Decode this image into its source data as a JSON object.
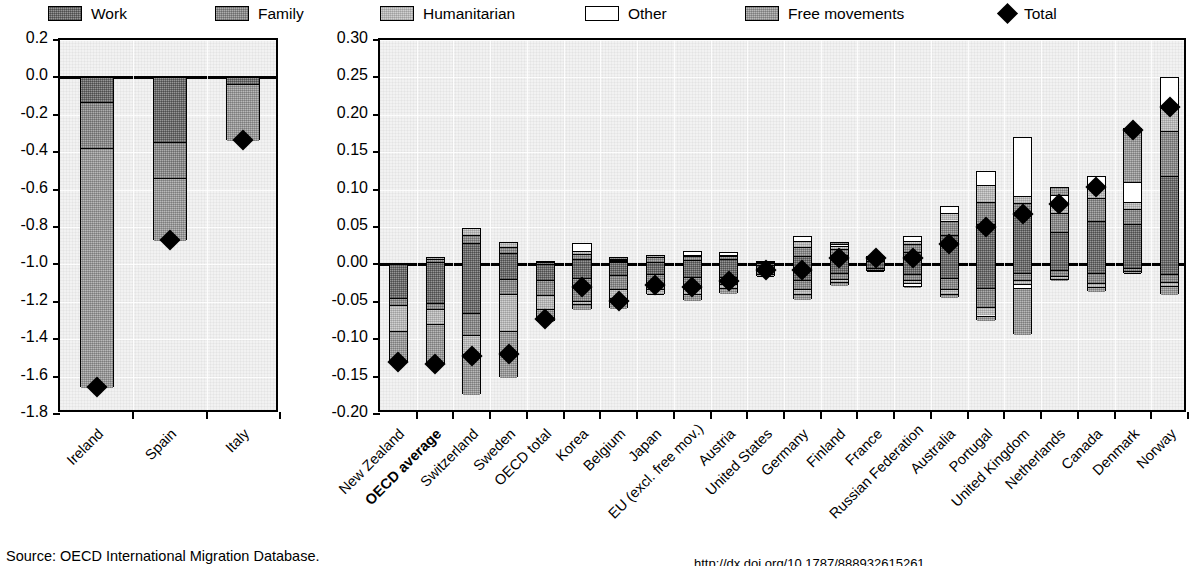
{
  "legend": {
    "items": [
      {
        "label": "Work",
        "fill": "work",
        "icon": "legend-swatch"
      },
      {
        "label": "Family",
        "fill": "family",
        "icon": "legend-swatch"
      },
      {
        "label": "Humanitarian",
        "fill": "human",
        "icon": "legend-swatch"
      },
      {
        "label": "Other",
        "fill": "other",
        "icon": "legend-swatch"
      },
      {
        "label": "Free movements",
        "fill": "free",
        "icon": "legend-swatch"
      },
      {
        "label": "Total",
        "fill": "diamond",
        "icon": "diamond-marker"
      }
    ]
  },
  "source": {
    "text": "Source: OECD International Migration Database.",
    "doi": "http://dx.doi.org/10.1787/888932615261"
  },
  "chart_data": [
    {
      "id": "left-panel",
      "type": "bar",
      "stacked": true,
      "title": "",
      "xlabel": "",
      "ylabel": "",
      "ylim": [
        -1.8,
        0.2
      ],
      "yticks": [
        0.2,
        0.0,
        -0.2,
        -0.4,
        -0.6,
        -0.8,
        -1.0,
        -1.2,
        -1.4,
        -1.6,
        -1.8
      ],
      "ytick_labels": [
        "0.2",
        "0.0",
        "-0.2",
        "-0.4",
        "-0.6",
        "-0.8",
        "-1.0",
        "-1.2",
        "-1.4",
        "-1.6",
        "-1.8"
      ],
      "grid": true,
      "categories": [
        "Ireland",
        "Spain",
        "Italy"
      ],
      "series": [
        {
          "name": "Work",
          "values": [
            -0.125,
            -0.34,
            -0.03
          ]
        },
        {
          "name": "Family",
          "values": [
            -0.245,
            -0.195,
            0
          ]
        },
        {
          "name": "Humanitarian",
          "values": [
            0,
            0,
            0
          ]
        },
        {
          "name": "Other",
          "values": [
            0,
            0,
            0
          ]
        },
        {
          "name": "Free movements",
          "values": [
            -1.285,
            -0.335,
            -0.305
          ]
        }
      ],
      "totals": [
        -1.655,
        -0.87,
        -0.335
      ]
    },
    {
      "id": "right-panel",
      "type": "bar",
      "stacked": true,
      "title": "",
      "xlabel": "",
      "ylabel": "",
      "ylim": [
        -0.2,
        0.3
      ],
      "yticks": [
        0.3,
        0.25,
        0.2,
        0.15,
        0.1,
        0.05,
        0.0,
        -0.05,
        -0.1,
        -0.15,
        -0.2
      ],
      "ytick_labels": [
        "0.30",
        "0.25",
        "0.20",
        "0.15",
        "0.10",
        "0.05",
        "0.00",
        "-0.05",
        "-0.10",
        "-0.15",
        "-0.20"
      ],
      "grid": true,
      "categories": [
        "New Zealand",
        "OECD average",
        "Switzerland",
        "Sweden",
        "OECD total",
        "Korea",
        "Belgium",
        "Japan",
        "EU (excl. free mov.)",
        "Austria",
        "United States",
        "Germany",
        "Finland",
        "France",
        "Russian Federation",
        "Australia",
        "Portugal",
        "United Kingdom",
        "Netherlands",
        "Canada",
        "Denmark",
        "Norway"
      ],
      "bold_categories": [
        "OECD average"
      ],
      "series": [
        {
          "name": "Work",
          "neg": [
            -0.043,
            -0.05,
            -0.063,
            -0.018,
            -0.02,
            -0.017,
            -0.013,
            -0.012,
            -0.016,
            -0.015,
            -0.008,
            -0.02,
            -0.01,
            -0.004,
            -0.012,
            -0.017,
            -0.03,
            -0.01,
            -0.006,
            -0.01,
            -0.004,
            -0.012
          ],
          "pos": [
            0,
            0.005,
            0.03,
            0.016,
            0.002,
            0.009,
            0.004,
            0.005,
            0.007,
            0.008,
            0.001,
            0.013,
            0.014,
            0.006,
            0.018,
            0.04,
            0.055,
            0.068,
            0.045,
            0.06,
            0.055,
            0.12
          ]
        },
        {
          "name": "Family",
          "neg": [
            -0.01,
            -0.008,
            -0.03,
            -0.02,
            -0.02,
            -0.03,
            -0.018,
            -0.02,
            -0.014,
            -0.01,
            -0.004,
            -0.012,
            -0.008,
            -0.002,
            -0.008,
            -0.015,
            -0.025,
            -0.01,
            -0.008,
            -0.013,
            -0.004,
            -0.01
          ],
          "pos": [
            0,
            0.003,
            0.01,
            0.008,
            0.002,
            0.006,
            0.002,
            0.006,
            0.005,
            0.004,
            0.002,
            0.012,
            0.008,
            0.003,
            0.01,
            0.02,
            0.03,
            0.015,
            0.025,
            0.03,
            0.02,
            0.06
          ]
        },
        {
          "name": "Humanitarian",
          "neg": [
            -0.035,
            -0.02,
            -0.025,
            -0.05,
            -0.018,
            -0.005,
            -0.012,
            -0.006,
            -0.008,
            -0.005,
            -0.002,
            -0.006,
            -0.004,
            -0.001,
            -0.004,
            -0.006,
            -0.012,
            -0.005,
            -0.004,
            -0.006,
            -0.002,
            -0.005
          ],
          "pos": [
            0,
            0.002,
            0.009,
            0.006,
            0.001,
            0.004,
            0.001,
            0.002,
            0.002,
            0.002,
            0.001,
            0.008,
            0.004,
            0.001,
            0.005,
            0.01,
            0.022,
            0.01,
            0.014,
            0.016,
            0.01,
            0.03
          ]
        },
        {
          "name": "Other",
          "neg": [
            0,
            0,
            0,
            0,
            0,
            0,
            0,
            0,
            0,
            0,
            0,
            0,
            0,
            0,
            -0.004,
            0,
            0,
            -0.005,
            0,
            0,
            0,
            0
          ],
          "pos": [
            0,
            0,
            0,
            0,
            0,
            0.01,
            0.002,
            0,
            0.004,
            0.002,
            0.001,
            0.005,
            0.003,
            0.001,
            0.005,
            0.008,
            0.018,
            0.077,
            0.01,
            0.012,
            0.027,
            0.04
          ]
        },
        {
          "name": "Free movements",
          "neg": [
            -0.042,
            -0.055,
            -0.055,
            -0.062,
            -0.018,
            -0.007,
            -0.015,
            -0.002,
            -0.01,
            -0.008,
            -0.002,
            -0.008,
            -0.006,
            -0.002,
            -0.002,
            -0.005,
            -0.008,
            -0.063,
            -0.003,
            -0.006,
            -0.002,
            -0.013
          ],
          "pos": [
            0,
            0,
            0,
            0,
            0,
            0,
            0.001,
            0,
            0,
            0,
            0,
            0,
            0.001,
            0,
            0,
            0,
            0,
            0,
            0.01,
            0,
            0.07,
            0
          ]
        }
      ],
      "totals": [
        -0.13,
        -0.133,
        -0.122,
        -0.12,
        -0.073,
        -0.03,
        -0.049,
        -0.027,
        -0.03,
        -0.022,
        -0.008,
        -0.008,
        0.009,
        0.009,
        0.008,
        0.027,
        0.05,
        0.067,
        0.081,
        0.103,
        0.18,
        0.21
      ]
    }
  ]
}
